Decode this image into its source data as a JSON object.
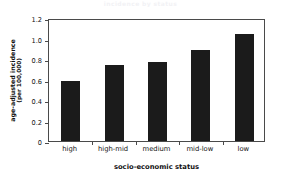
{
  "figure": {
    "title_remnant": "incidence by status",
    "accent_color": "#1b1b1b",
    "axis_color": "#4a4a4a",
    "background": "#ffffff"
  },
  "axes": {
    "ylabel_line1": "age-adjusted incidence",
    "ylabel_line2": "(per 100,000)",
    "xlabel": "socio-economic status",
    "ytick_labels": [
      "0",
      "0.2",
      "0.4",
      "0.6",
      "0.8",
      "1.0",
      "1.2"
    ]
  },
  "chart_data": {
    "type": "bar",
    "title": "",
    "categories": [
      "high",
      "high-mid",
      "medium",
      "mid-low",
      "low"
    ],
    "values": [
      0.59,
      0.745,
      0.775,
      0.885,
      1.04
    ],
    "xlabel": "socio-economic status",
    "ylabel": "age-adjusted incidence (per 100,000)",
    "ylim": [
      0,
      1.2
    ],
    "yticks": [
      0,
      0.2,
      0.4,
      0.6,
      0.8,
      1.0,
      1.2
    ],
    "ytick_labels": [
      "0",
      "0.2",
      "0.4",
      "0.6",
      "0.8",
      "1.0",
      "1.2"
    ],
    "grid": false,
    "legend": null,
    "bar_color": "#1b1b1b"
  }
}
